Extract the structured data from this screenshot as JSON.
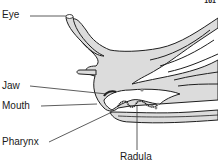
{
  "diagram": {
    "page_number": "161",
    "labels": {
      "eye": "Eye",
      "jaw": "Jaw",
      "mouth": "Mouth",
      "pharynx": "Pharynx",
      "radula": "Radula"
    },
    "colors": {
      "body_fill": "#dcdcdc",
      "outline": "#1e1e1e",
      "leader_line": "#333333",
      "background": "#ffffff"
    }
  }
}
